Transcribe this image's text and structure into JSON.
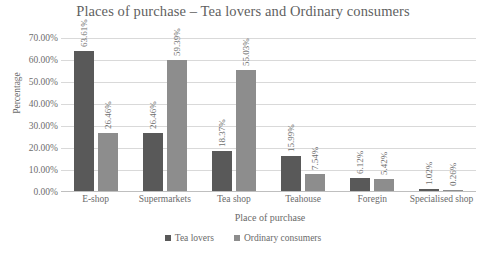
{
  "chart_data": {
    "type": "bar",
    "title": "Places of purchase – Tea lovers and Ordinary consumers",
    "xlabel": "Place of purchase",
    "ylabel": "Percentage",
    "ylim": [
      0,
      70
    ],
    "ytick_labels": [
      "70.00%",
      "60.00%",
      "50.00%",
      "40.00%",
      "30.00%",
      "20.00%",
      "10.00%",
      "0.00%"
    ],
    "ytick_values": [
      70,
      60,
      50,
      40,
      30,
      20,
      10,
      0
    ],
    "grid": true,
    "legend_position": "bottom",
    "categories": [
      "E-shop",
      "Supermarkets",
      "Tea shop",
      "Teahouse",
      "Foregin",
      "Specialised shop"
    ],
    "series": [
      {
        "name": "Tea lovers",
        "color": "#595959",
        "values": [
          63.61,
          26.46,
          18.37,
          15.99,
          6.12,
          1.02
        ],
        "labels": [
          "63.61%",
          "26.46%",
          "18.37%",
          "15.99%",
          "6.12%",
          "1.02%"
        ]
      },
      {
        "name": "Ordinary consumers",
        "color": "#8d8d8d",
        "values": [
          26.46,
          59.39,
          55.03,
          7.54,
          5.42,
          0.26
        ],
        "labels": [
          "26.46%",
          "59.39%",
          "55.03%",
          "7.54%",
          "5.42%",
          "0.26%"
        ]
      }
    ]
  }
}
